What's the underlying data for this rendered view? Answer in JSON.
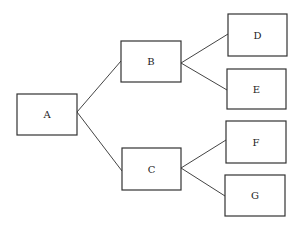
{
  "diagram": {
    "type": "tree",
    "nodes": [
      {
        "id": "A",
        "label": "A",
        "x": 17,
        "y": 94,
        "w": 60,
        "h": 41
      },
      {
        "id": "B",
        "label": "B",
        "x": 121,
        "y": 41,
        "w": 60,
        "h": 41
      },
      {
        "id": "C",
        "label": "C",
        "x": 122,
        "y": 148,
        "w": 59,
        "h": 42
      },
      {
        "id": "D",
        "label": "D",
        "x": 228,
        "y": 14,
        "w": 59,
        "h": 42
      },
      {
        "id": "E",
        "label": "E",
        "x": 227,
        "y": 69,
        "w": 59,
        "h": 40
      },
      {
        "id": "F",
        "label": "F",
        "x": 226,
        "y": 121,
        "w": 60,
        "h": 42
      },
      {
        "id": "G",
        "label": "G",
        "x": 225,
        "y": 175,
        "w": 60,
        "h": 41
      }
    ],
    "edges": [
      {
        "from": "A",
        "to": "B",
        "x1": 77,
        "y1": 112,
        "x2": 121,
        "y2": 61
      },
      {
        "from": "A",
        "to": "C",
        "x1": 77,
        "y1": 112,
        "x2": 122,
        "y2": 171
      },
      {
        "from": "B",
        "to": "D",
        "x1": 181,
        "y1": 63,
        "x2": 228,
        "y2": 34
      },
      {
        "from": "B",
        "to": "E",
        "x1": 181,
        "y1": 63,
        "x2": 227,
        "y2": 90
      },
      {
        "from": "C",
        "to": "F",
        "x1": 181,
        "y1": 168,
        "x2": 226,
        "y2": 140
      },
      {
        "from": "C",
        "to": "G",
        "x1": 181,
        "y1": 168,
        "x2": 225,
        "y2": 196
      }
    ]
  }
}
